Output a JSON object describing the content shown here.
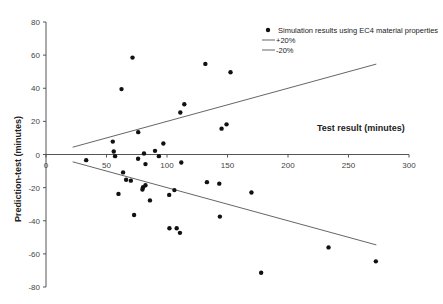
{
  "chart_data": {
    "type": "scatter",
    "title": "",
    "xlabel": "Test result (minutes)",
    "ylabel": "Prediction-test (minutes)",
    "xlim": [
      0,
      300
    ],
    "ylim": [
      -80,
      80
    ],
    "x_ticks": [
      0,
      50,
      100,
      150,
      200,
      250,
      300
    ],
    "y_ticks": [
      80,
      60,
      40,
      20,
      0,
      -20,
      -40,
      -60,
      -80
    ],
    "grid": false,
    "legend_position": "top-right",
    "series": [
      {
        "name": "Simulation results using EC4 material properties",
        "kind": "scatter",
        "points": [
          [
            71.5,
            58.5
          ],
          [
            62.4,
            39.5
          ],
          [
            131.7,
            54.7
          ],
          [
            152.5,
            49.7
          ],
          [
            114.3,
            30.3
          ],
          [
            111.0,
            25.4
          ],
          [
            145.1,
            15.6
          ],
          [
            149.2,
            18.2
          ],
          [
            76.2,
            13.5
          ],
          [
            55.2,
            7.8
          ],
          [
            56.0,
            1.8
          ],
          [
            57.1,
            -1.0
          ],
          [
            33.2,
            -3.4
          ],
          [
            76.1,
            -2.6
          ],
          [
            81.0,
            0.6
          ],
          [
            82.2,
            -5.8
          ],
          [
            90.1,
            2.2
          ],
          [
            93.3,
            -1.0
          ],
          [
            97.0,
            6.6
          ],
          [
            111.8,
            -4.8
          ],
          [
            63.7,
            -10.8
          ],
          [
            66.2,
            -15.2
          ],
          [
            70.1,
            -15.8
          ],
          [
            59.9,
            -23.8
          ],
          [
            80.2,
            -19.7
          ],
          [
            82.2,
            -18.6
          ],
          [
            79.7,
            -21.1
          ],
          [
            85.9,
            -27.7
          ],
          [
            106.1,
            -21.5
          ],
          [
            101.8,
            -24.4
          ],
          [
            72.8,
            -36.5
          ],
          [
            102.0,
            -44.5
          ],
          [
            108.0,
            -44.5
          ],
          [
            110.7,
            -47.3
          ],
          [
            133.0,
            -16.7
          ],
          [
            143.2,
            -17.6
          ],
          [
            169.8,
            -22.9
          ],
          [
            143.7,
            -37.5
          ],
          [
            233.5,
            -56.1
          ],
          [
            272.6,
            -64.5
          ],
          [
            177.8,
            -71.4
          ]
        ]
      },
      {
        "name": "+20%",
        "kind": "line",
        "points": [
          [
            22,
            4.4
          ],
          [
            273,
            54.6
          ]
        ]
      },
      {
        "name": "-20%",
        "kind": "line",
        "points": [
          [
            22,
            -4.4
          ],
          [
            273,
            -54.6
          ]
        ]
      }
    ]
  },
  "legend": {
    "items": [
      {
        "label": "Simulation results using EC4 material properties",
        "symbol": "dot"
      },
      {
        "label": "+20%",
        "symbol": "line"
      },
      {
        "label": "-20%",
        "symbol": "line"
      }
    ]
  },
  "colors": {
    "points": "#111111",
    "lines": "#666666",
    "axes": "#555555"
  }
}
